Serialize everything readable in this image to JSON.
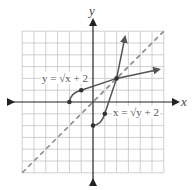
{
  "diagram": {
    "type": "function-inverse-graph",
    "axes": {
      "x_label": "x",
      "y_label": "y",
      "grid": {
        "xmin": -6,
        "xmax": 6,
        "ymin": -6,
        "ymax": 6,
        "step": 1
      }
    },
    "curves": [
      {
        "name": "y = sqrt(x+2)",
        "label_text": "y = √x + 2",
        "style": "solid",
        "points": [
          [
            -2,
            0
          ],
          [
            -1,
            1
          ],
          [
            2,
            2
          ]
        ],
        "arrow_end": [
          5.5,
          2.7
        ]
      },
      {
        "name": "x = sqrt(y+2)",
        "label_text": "x = √y + 2",
        "style": "solid",
        "points": [
          [
            0,
            -2
          ],
          [
            1,
            -1
          ],
          [
            2,
            2
          ]
        ],
        "arrow_end": [
          2.7,
          5.5
        ]
      },
      {
        "name": "y = x",
        "style": "dashed"
      }
    ],
    "colors": {
      "grid": "#bdbdbd",
      "axis": "#222222",
      "curve": "#555555",
      "dashed": "#8a8a8a"
    }
  }
}
